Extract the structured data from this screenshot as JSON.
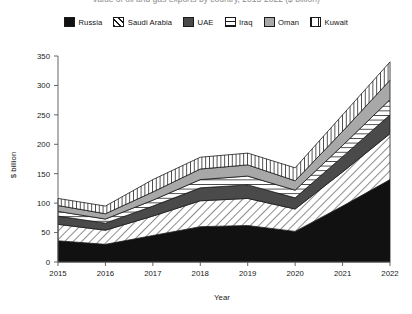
{
  "title": {
    "text": "Value of oil and gas exports by country, 2015-2022 ($ billion)",
    "visible_partial": true
  },
  "legend": {
    "position": "top-center",
    "items": [
      {
        "label": "Russia",
        "pattern": "solid-black",
        "color": "#111111",
        "class": "p-russia"
      },
      {
        "label": "Saudi Arabia",
        "pattern": "diagonal-hatch",
        "color": "#1a1a1a",
        "class": "p-saudi"
      },
      {
        "label": "UAE",
        "pattern": "solid-dark-gray",
        "color": "#4a4a4a",
        "class": "p-uae"
      },
      {
        "label": "Iraq",
        "pattern": "horizontal-lines",
        "color": "#1a1a1a",
        "class": "p-iraq"
      },
      {
        "label": "Oman",
        "pattern": "solid-gray",
        "color": "#a8a8a8",
        "class": "p-oman"
      },
      {
        "label": "Kuwait",
        "pattern": "vertical-lines",
        "color": "#1a1a1a",
        "class": "p-kuwait"
      }
    ]
  },
  "axes": {
    "x": {
      "title": "Year",
      "ticks": [
        "2015",
        "2016",
        "2017",
        "2018",
        "2019",
        "2020",
        "2021",
        "2022"
      ]
    },
    "y": {
      "title": "$ billion",
      "ticks": [
        "0",
        "50",
        "100",
        "150",
        "200",
        "250",
        "300",
        "350"
      ],
      "min": 0,
      "max": 350,
      "step": 50
    }
  },
  "chart_data": {
    "type": "area",
    "stacked": true,
    "title": "Value of oil and gas exports by country, 2015-2022 ($ billion)",
    "xlabel": "Year",
    "ylabel": "$ billion",
    "ylim": [
      0,
      350
    ],
    "xlim": [
      "2015",
      "2022"
    ],
    "grid": false,
    "legend_position": "top-center",
    "categories": [
      "2015",
      "2016",
      "2017",
      "2018",
      "2019",
      "2020",
      "2021",
      "2022"
    ],
    "series": [
      {
        "name": "Russia",
        "values": [
          36,
          30,
          45,
          60,
          62,
          52,
          95,
          140
        ]
      },
      {
        "name": "Saudi Arabia",
        "values": [
          28,
          24,
          33,
          44,
          46,
          38,
          58,
          78
        ]
      },
      {
        "name": "UAE",
        "values": [
          14,
          12,
          17,
          22,
          23,
          19,
          26,
          32
        ]
      },
      {
        "name": "Iraq",
        "values": [
          8,
          7,
          10,
          14,
          15,
          13,
          19,
          26
        ]
      },
      {
        "name": "Oman",
        "values": [
          10,
          9,
          14,
          18,
          19,
          16,
          24,
          33
        ]
      },
      {
        "name": "Kuwait",
        "values": [
          12,
          13,
          21,
          20,
          20,
          22,
          28,
          31
        ]
      }
    ],
    "totals": [
      108,
      95,
      140,
      178,
      185,
      160,
      250,
      340
    ]
  }
}
